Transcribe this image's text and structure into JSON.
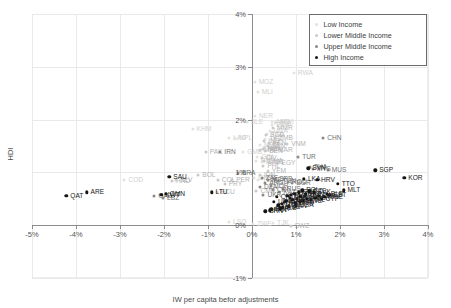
{
  "chart_data": {
    "type": "scatter",
    "title": "",
    "xlabel": "IW per capita befor adjustments",
    "ylabel": "HDI",
    "xlim": [
      -5,
      4
    ],
    "ylim": [
      -1,
      4
    ],
    "xticks": [
      "-5%",
      "-4%",
      "-3%",
      "-2%",
      "-1%",
      "0%",
      "1%",
      "2%",
      "3%",
      "4%"
    ],
    "xtick_values": [
      -5,
      -4,
      -3,
      -2,
      -1,
      0,
      1,
      2,
      3,
      4
    ],
    "yticks": [
      "4%",
      "3%",
      "2%",
      "1%",
      "0%",
      "-1%"
    ],
    "ytick_values": [
      4,
      3,
      2,
      1,
      0,
      -1
    ],
    "grid": true,
    "legend_position": "top-right",
    "legend": [
      {
        "label": "Low Income",
        "color": "#e2e2e2"
      },
      {
        "label": "Lower Middle Income",
        "color": "#c9c9c9"
      },
      {
        "label": "Upper Middle Income",
        "color": "#8a8a8a"
      },
      {
        "label": "High Income",
        "color": "#161616"
      }
    ],
    "series": [
      {
        "name": "Low Income",
        "group": 0,
        "points": [
          {
            "label": "RWA",
            "x": 0.95,
            "y": 2.88
          },
          {
            "label": "MOZ",
            "x": 0.06,
            "y": 2.72
          },
          {
            "label": "MLI",
            "x": 0.13,
            "y": 2.52
          },
          {
            "label": "NER",
            "x": 0.07,
            "y": 2.07
          },
          {
            "label": "SLE",
            "x": -0.12,
            "y": 1.96
          },
          {
            "label": "KHM",
            "x": -1.35,
            "y": 1.83
          },
          {
            "label": "MWI",
            "x": 0.55,
            "y": 1.95
          },
          {
            "label": "AFG",
            "x": 0.45,
            "y": 1.95
          },
          {
            "label": "BFA",
            "x": 0.52,
            "y": 1.93
          },
          {
            "label": "ETH",
            "x": 0.46,
            "y": 1.9
          },
          {
            "label": "UGA",
            "x": 0.4,
            "y": 1.78
          },
          {
            "label": "TZA",
            "x": 0.34,
            "y": 1.72
          },
          {
            "label": "LAO",
            "x": -0.52,
            "y": 1.66
          },
          {
            "label": "NPL",
            "x": -0.38,
            "y": 1.66
          },
          {
            "label": "TCD",
            "x": 0.3,
            "y": 1.64
          },
          {
            "label": "BDI",
            "x": 0.27,
            "y": 1.48
          },
          {
            "label": "MDG",
            "x": 0.18,
            "y": 1.52
          },
          {
            "label": "GMB",
            "x": -0.2,
            "y": 1.38
          },
          {
            "label": "GIN",
            "x": 0.12,
            "y": 1.3
          },
          {
            "label": "HTI",
            "x": 0.1,
            "y": 1.22
          },
          {
            "label": "MLI2",
            "x": 0.22,
            "y": 1.2
          },
          {
            "label": "LSO",
            "x": -0.52,
            "y": 0.06
          },
          {
            "label": "ZWE",
            "x": 0.02,
            "y": 0.02
          },
          {
            "label": "TJK",
            "x": 0.48,
            "y": 0.04
          },
          {
            "label": "COD",
            "x": -2.9,
            "y": 0.86
          },
          {
            "label": "GNB",
            "x": 0.05,
            "y": 0.9
          },
          {
            "label": "TGO",
            "x": 0.14,
            "y": 0.86
          }
        ]
      },
      {
        "name": "Lower Middle Income",
        "group": 1,
        "points": [
          {
            "label": "MMR",
            "x": 0.48,
            "y": 1.85
          },
          {
            "label": "BGD",
            "x": 0.32,
            "y": 1.7
          },
          {
            "label": "ZMB",
            "x": 0.52,
            "y": 1.66
          },
          {
            "label": "IND",
            "x": 0.28,
            "y": 1.6
          },
          {
            "label": "KEN",
            "x": 0.38,
            "y": 1.55
          },
          {
            "label": "VNM",
            "x": 0.8,
            "y": 1.53
          },
          {
            "label": "PAK",
            "x": -1.05,
            "y": 1.38
          },
          {
            "label": "MRT",
            "x": 0.18,
            "y": 1.42
          },
          {
            "label": "MAR",
            "x": 0.5,
            "y": 1.43
          },
          {
            "label": "SEN",
            "x": 0.36,
            "y": 1.5
          },
          {
            "label": "CIV",
            "x": 0.22,
            "y": 1.28
          },
          {
            "label": "GHA",
            "x": 0.28,
            "y": 1.22
          },
          {
            "label": "NIC",
            "x": 0.38,
            "y": 1.2
          },
          {
            "label": "EGY",
            "x": 0.58,
            "y": 1.18
          },
          {
            "label": "PHL",
            "x": 0.26,
            "y": 1.12
          },
          {
            "label": "YEM",
            "x": 0.36,
            "y": 1.02
          },
          {
            "label": "BOL",
            "x": -1.22,
            "y": 0.95
          },
          {
            "label": "COL",
            "x": -0.78,
            "y": 0.85
          },
          {
            "label": "PER",
            "x": -0.45,
            "y": 0.86
          },
          {
            "label": "PRY",
            "x": -0.62,
            "y": 0.78
          },
          {
            "label": "ECU",
            "x": -0.8,
            "y": 0.62
          },
          {
            "label": "HND",
            "x": -1.82,
            "y": 0.84
          },
          {
            "label": "SLV",
            "x": -1.72,
            "y": 0.86
          },
          {
            "label": "IDN",
            "x": 0.18,
            "y": 0.95
          },
          {
            "label": "CMR",
            "x": 0.1,
            "y": 0.64
          },
          {
            "label": "SWZ",
            "x": 0.88,
            "y": -0.02
          },
          {
            "label": "BEN",
            "x": 0.3,
            "y": 1.4
          },
          {
            "label": "NGA",
            "x": 0.26,
            "y": 1.45
          }
        ]
      },
      {
        "name": "Upper Middle Income",
        "group": 2,
        "points": [
          {
            "label": "CHN",
            "x": 1.62,
            "y": 1.66
          },
          {
            "label": "TUR",
            "x": 1.05,
            "y": 1.3
          },
          {
            "label": "IRN",
            "x": -0.72,
            "y": 1.38
          },
          {
            "label": "BRA",
            "x": -0.32,
            "y": 0.98
          },
          {
            "label": "MUS",
            "x": 1.72,
            "y": 1.05
          },
          {
            "label": "THA",
            "x": 1.32,
            "y": 1.1
          },
          {
            "label": "MYS",
            "x": 1.38,
            "y": 1.06
          },
          {
            "label": "ZAF",
            "x": 0.22,
            "y": 0.9
          },
          {
            "label": "SRB",
            "x": 0.52,
            "y": 0.88
          },
          {
            "label": "MEX",
            "x": 0.36,
            "y": 0.86
          },
          {
            "label": "ARG",
            "x": 0.3,
            "y": 0.8
          },
          {
            "label": "GAB",
            "x": -2.22,
            "y": 0.55
          },
          {
            "label": "LBZ",
            "x": -2.02,
            "y": 0.52
          },
          {
            "label": "DZA",
            "x": 0.18,
            "y": 0.72
          },
          {
            "label": "JOR",
            "x": 0.44,
            "y": 0.74
          },
          {
            "label": "TUN",
            "x": 0.6,
            "y": 0.84
          },
          {
            "label": "ROU",
            "x": 0.82,
            "y": 0.82
          },
          {
            "label": "BGR",
            "x": 0.92,
            "y": 0.8
          },
          {
            "label": "RUS",
            "x": 0.7,
            "y": 0.68
          },
          {
            "label": "KAZ",
            "x": 0.62,
            "y": 0.62
          },
          {
            "label": "UKR",
            "x": 0.26,
            "y": 0.58
          },
          {
            "label": "CRI",
            "x": 0.48,
            "y": 0.66
          }
        ]
      },
      {
        "name": "High Income",
        "group": 3,
        "points": [
          {
            "label": "QAT",
            "x": -4.22,
            "y": 0.56
          },
          {
            "label": "ARE",
            "x": -3.76,
            "y": 0.62
          },
          {
            "label": "KWT",
            "x": -2.06,
            "y": 0.58
          },
          {
            "label": "LTU",
            "x": -0.92,
            "y": 0.62
          },
          {
            "label": "SGP",
            "x": 2.8,
            "y": 1.04
          },
          {
            "label": "KOR",
            "x": 3.46,
            "y": 0.9
          },
          {
            "label": "SVN",
            "x": 1.28,
            "y": 1.08
          },
          {
            "label": "LKA",
            "x": 1.18,
            "y": 0.88
          },
          {
            "label": "HRV",
            "x": 1.48,
            "y": 0.86
          },
          {
            "label": "MLT",
            "x": 2.08,
            "y": 0.66
          },
          {
            "label": "TTO",
            "x": 1.95,
            "y": 0.78
          },
          {
            "label": "EST",
            "x": 1.76,
            "y": 0.58
          },
          {
            "label": "USA",
            "x": 1.0,
            "y": 0.38
          },
          {
            "label": "JPN",
            "x": 1.2,
            "y": 0.56
          },
          {
            "label": "DEU",
            "x": 0.96,
            "y": 0.6
          },
          {
            "label": "FRA",
            "x": 0.88,
            "y": 0.58
          },
          {
            "label": "GBR",
            "x": 1.06,
            "y": 0.62
          },
          {
            "label": "ITA",
            "x": 0.8,
            "y": 0.56
          },
          {
            "label": "ESP",
            "x": 0.86,
            "y": 0.52
          },
          {
            "label": "NLD",
            "x": 1.1,
            "y": 0.54
          },
          {
            "label": "POL",
            "x": 1.14,
            "y": 0.66
          },
          {
            "label": "CZE",
            "x": 1.3,
            "y": 0.64
          },
          {
            "label": "SVK",
            "x": 1.4,
            "y": 0.62
          },
          {
            "label": "HUN",
            "x": 1.22,
            "y": 0.6
          },
          {
            "label": "AUT",
            "x": 1.02,
            "y": 0.5
          },
          {
            "label": "BEL",
            "x": 0.92,
            "y": 0.48
          },
          {
            "label": "SWE",
            "x": 1.16,
            "y": 0.46
          },
          {
            "label": "NOR",
            "x": 0.74,
            "y": 0.44
          },
          {
            "label": "DNK",
            "x": 0.98,
            "y": 0.42
          },
          {
            "label": "FIN",
            "x": 1.08,
            "y": 0.44
          },
          {
            "label": "IRL",
            "x": 1.34,
            "y": 0.48
          },
          {
            "label": "PRT",
            "x": 1.24,
            "y": 0.5
          },
          {
            "label": "GRC",
            "x": 0.78,
            "y": 0.46
          },
          {
            "label": "CHE",
            "x": 0.68,
            "y": 0.4
          },
          {
            "label": "CAN",
            "x": 0.84,
            "y": 0.36
          },
          {
            "label": "AUS",
            "x": 0.7,
            "y": 0.34
          },
          {
            "label": "NZL",
            "x": 0.6,
            "y": 0.38
          },
          {
            "label": "ISR",
            "x": 1.44,
            "y": 0.52
          },
          {
            "label": "CHL",
            "x": 0.56,
            "y": 0.54
          },
          {
            "label": "URY",
            "x": 0.5,
            "y": 0.44
          },
          {
            "label": "SAU",
            "x": -1.88,
            "y": 0.92
          },
          {
            "label": "OMN",
            "x": -1.96,
            "y": 0.6
          },
          {
            "label": "LVA",
            "x": 1.52,
            "y": 0.56
          },
          {
            "label": "CYP",
            "x": 1.58,
            "y": 0.5
          },
          {
            "label": "BHR",
            "x": 0.44,
            "y": 0.3
          },
          {
            "label": "PAN",
            "x": 0.4,
            "y": 0.28
          },
          {
            "label": "BRN",
            "x": 0.3,
            "y": 0.26
          },
          {
            "label": "MNE",
            "x": 1.64,
            "y": 0.54
          },
          {
            "label": "BLR",
            "x": 1.7,
            "y": 0.6
          },
          {
            "label": "ALB",
            "x": 0.64,
            "y": 0.32
          }
        ]
      }
    ]
  }
}
